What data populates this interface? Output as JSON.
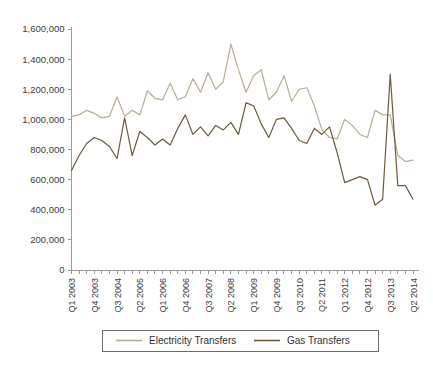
{
  "chart_data": {
    "type": "line",
    "title": "",
    "subtitle": "",
    "xlabel": "",
    "ylabel": "",
    "ylim": [
      0,
      1600000
    ],
    "ytick_values": [
      0,
      200000,
      400000,
      600000,
      800000,
      1000000,
      1200000,
      1400000,
      1600000
    ],
    "ytick_labels": [
      "0",
      "200,000",
      "400,000",
      "600,000",
      "800,000",
      "1,000,000",
      "1,200,000",
      "1,400,000",
      "1,600,000"
    ],
    "grid": false,
    "legend_position": "bottom",
    "x": [
      "Q1 2003",
      "Q2 2003",
      "Q3 2003",
      "Q4 2003",
      "Q1 2004",
      "Q2 2004",
      "Q3 2004",
      "Q4 2004",
      "Q1 2005",
      "Q2 2005",
      "Q3 2005",
      "Q4 2005",
      "Q1 2006",
      "Q2 2006",
      "Q3 2006",
      "Q4 2006",
      "Q1 2007",
      "Q2 2007",
      "Q3 2007",
      "Q4 2007",
      "Q1 2008",
      "Q2 2008",
      "Q3 2008",
      "Q4 2008",
      "Q1 2009",
      "Q2 2009",
      "Q3 2009",
      "Q4 2009",
      "Q1 2010",
      "Q2 2010",
      "Q3 2010",
      "Q4 2010",
      "Q1 2011",
      "Q2 2011",
      "Q3 2011",
      "Q4 2011",
      "Q1 2012",
      "Q2 2012",
      "Q3 2012",
      "Q4 2012",
      "Q1 2013",
      "Q2 2013",
      "Q3 2013",
      "Q4 2013",
      "Q1 2014",
      "Q2 2014"
    ],
    "xtick_labels_shown": [
      "Q1 2003",
      "Q4 2003",
      "Q3 2004",
      "Q2 2005",
      "Q1 2006",
      "Q4 2006",
      "Q3 2007",
      "Q2 2008",
      "Q1 2009",
      "Q4 2009",
      "Q3 2010",
      "Q2 2011",
      "Q1 2012",
      "Q4 2012",
      "Q3 2013",
      "Q2 2014"
    ],
    "xtick_label_interval": 3,
    "series": [
      {
        "name": "Electricity Transfers",
        "color": "#b8ad90",
        "values": [
          1020000,
          1030000,
          1060000,
          1040000,
          1010000,
          1020000,
          1150000,
          1020000,
          1060000,
          1030000,
          1190000,
          1140000,
          1130000,
          1240000,
          1130000,
          1150000,
          1270000,
          1180000,
          1310000,
          1200000,
          1250000,
          1500000,
          1330000,
          1180000,
          1290000,
          1330000,
          1130000,
          1180000,
          1290000,
          1120000,
          1200000,
          1210000,
          1090000,
          930000,
          880000,
          870000,
          1000000,
          960000,
          900000,
          880000,
          1060000,
          1030000,
          1030000,
          760000,
          720000,
          730000
        ]
      },
      {
        "name": "Gas Transfers",
        "color": "#6b5b3c",
        "values": [
          660000,
          760000,
          840000,
          880000,
          860000,
          820000,
          740000,
          1010000,
          760000,
          920000,
          880000,
          830000,
          870000,
          830000,
          940000,
          1030000,
          900000,
          950000,
          890000,
          960000,
          930000,
          980000,
          900000,
          1110000,
          1090000,
          970000,
          880000,
          1000000,
          1010000,
          940000,
          860000,
          840000,
          940000,
          900000,
          950000,
          780000,
          580000,
          600000,
          620000,
          600000,
          430000,
          470000,
          1300000,
          560000,
          560000,
          470000
        ]
      }
    ]
  },
  "legend": {
    "items": [
      {
        "label": "Electricity Transfers",
        "color": "#b8ad90"
      },
      {
        "label": "Gas Transfers",
        "color": "#6b5b3c"
      }
    ]
  }
}
